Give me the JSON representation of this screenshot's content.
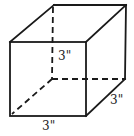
{
  "diagram": {
    "type": "cube",
    "labels": {
      "height": "3\"",
      "depth": "3\"",
      "width": "3\""
    },
    "colors": {
      "line": "#1a1a1a",
      "background": "#ffffff"
    }
  }
}
